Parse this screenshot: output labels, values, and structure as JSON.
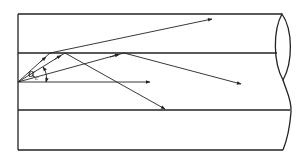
{
  "diagram": {
    "type": "optical-fiber-ray-propagation",
    "angle_label": {
      "symbol": "α",
      "subscript": "c"
    },
    "colors": {
      "stroke": "#222222",
      "background": "#ffffff"
    },
    "fiber": {
      "outer_top_y": 14,
      "core_top_y": 53,
      "core_bottom_y": 110,
      "outer_bottom_y": 150,
      "left_x": 18,
      "right_end_x": 283
    },
    "source_point": [
      18,
      82
    ],
    "rays": [
      {
        "name": "refracted-out-ray",
        "points": [
          [
            18,
            82
          ],
          [
            50,
            53
          ],
          [
            212,
            19
          ]
        ],
        "arrows": [
          [
            45,
            57
          ],
          [
            212,
            19
          ]
        ]
      },
      {
        "name": "steep-reflected-ray",
        "points": [
          [
            18,
            82
          ],
          [
            65,
            53
          ],
          [
            165,
            109
          ]
        ],
        "arrows": [
          [
            60,
            56
          ],
          [
            165,
            109
          ]
        ]
      },
      {
        "name": "shallow-reflected-ray",
        "points": [
          [
            18,
            82
          ],
          [
            124,
            53
          ],
          [
            241,
            84
          ]
        ],
        "arrows": [
          [
            118,
            55
          ],
          [
            241,
            84
          ]
        ]
      },
      {
        "name": "axial-ray",
        "points": [
          [
            18,
            82
          ],
          [
            150,
            82
          ]
        ],
        "arrows": [
          [
            150,
            82
          ]
        ]
      }
    ]
  }
}
